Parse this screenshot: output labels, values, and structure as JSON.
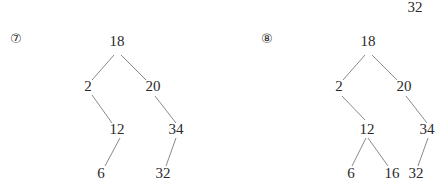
{
  "floating_label": {
    "text": "32",
    "x": 415,
    "y": 12
  },
  "trees": [
    {
      "step_label": "⑦",
      "step_pos": {
        "x": 10,
        "y": 43
      },
      "nodes": [
        {
          "id": "n18",
          "value": "18",
          "x": 117,
          "y": 46
        },
        {
          "id": "n2",
          "value": "2",
          "x": 88,
          "y": 91
        },
        {
          "id": "n20",
          "value": "20",
          "x": 153,
          "y": 91
        },
        {
          "id": "n12",
          "value": "12",
          "x": 117,
          "y": 134
        },
        {
          "id": "n34",
          "value": "34",
          "x": 176,
          "y": 134
        },
        {
          "id": "n6",
          "value": "6",
          "x": 101,
          "y": 178
        },
        {
          "id": "n32",
          "value": "32",
          "x": 163,
          "y": 178
        }
      ],
      "edges": [
        {
          "from": [
            114,
            55
          ],
          "to": [
            92,
            80
          ]
        },
        {
          "from": [
            121,
            55
          ],
          "to": [
            146,
            80
          ]
        },
        {
          "from": [
            92,
            95
          ],
          "to": [
            112,
            123
          ]
        },
        {
          "from": [
            155,
            96
          ],
          "to": [
            176,
            123
          ]
        },
        {
          "from": [
            120,
            138
          ],
          "to": [
            105,
            166
          ]
        },
        {
          "from": [
            176,
            138
          ],
          "to": [
            166,
            166
          ]
        }
      ]
    },
    {
      "step_label": "⑧",
      "step_pos": {
        "x": 261,
        "y": 43
      },
      "nodes": [
        {
          "id": "n18",
          "value": "18",
          "x": 368,
          "y": 46
        },
        {
          "id": "n2",
          "value": "2",
          "x": 339,
          "y": 91
        },
        {
          "id": "n20",
          "value": "20",
          "x": 404,
          "y": 91
        },
        {
          "id": "n12",
          "value": "12",
          "x": 367,
          "y": 134
        },
        {
          "id": "n34",
          "value": "34",
          "x": 427,
          "y": 134
        },
        {
          "id": "n6",
          "value": "6",
          "x": 351,
          "y": 178
        },
        {
          "id": "n16",
          "value": "16",
          "x": 392,
          "y": 178
        },
        {
          "id": "n32",
          "value": "32",
          "x": 416,
          "y": 178
        }
      ],
      "edges": [
        {
          "from": [
            365,
            55
          ],
          "to": [
            343,
            80
          ]
        },
        {
          "from": [
            372,
            55
          ],
          "to": [
            397,
            80
          ]
        },
        {
          "from": [
            342,
            96
          ],
          "to": [
            365,
            120
          ]
        },
        {
          "from": [
            406,
            96
          ],
          "to": [
            427,
            123
          ]
        },
        {
          "from": [
            366,
            138
          ],
          "to": [
            352,
            166
          ]
        },
        {
          "from": [
            368,
            138
          ],
          "to": [
            388,
            166
          ]
        },
        {
          "from": [
            428,
            138
          ],
          "to": [
            418,
            166
          ]
        }
      ]
    }
  ]
}
